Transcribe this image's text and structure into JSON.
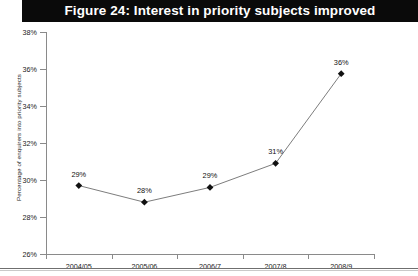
{
  "title": {
    "text": "Figure 24: Interest in priority subjects improved",
    "banner_color": "#0a0a0a",
    "text_color": "#ffffff"
  },
  "chart_data": {
    "type": "line",
    "title": "Figure 24: Interest in priority subjects improved",
    "xlabel": "",
    "ylabel": "Percentage of enquirers into priority subjects",
    "categories": [
      "2004/05",
      "2005/06",
      "2006/7",
      "2007/8",
      "2008/9"
    ],
    "values": [
      29.7,
      28.8,
      29.6,
      30.9,
      35.75
    ],
    "data_labels": [
      "29%",
      "28%",
      "29%",
      "31%",
      "36%"
    ],
    "ylim": [
      26,
      38
    ],
    "yticks": [
      26,
      28,
      30,
      32,
      34,
      36,
      38
    ],
    "ytick_labels": [
      "26%",
      "28%",
      "30%",
      "32%",
      "34%",
      "36%",
      "38%"
    ],
    "grid": false,
    "legend": false,
    "marker": "diamond",
    "marker_color": "#111111",
    "line_color": "#7d7d7d"
  },
  "axes": {
    "y_title": "Percentage of enquirers into priority subjects"
  }
}
